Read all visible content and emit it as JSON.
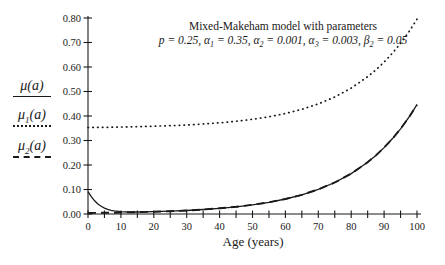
{
  "chart_data": {
    "type": "line",
    "title": "Mixed-Makeham model with parameters",
    "subtitle": "p = 0.25, a1 = 0.35, a2 = 0.001, a3 = 0.003, b2 = 0.05",
    "subtitle_segments": [
      {
        "t": "p = 0.25, α"
      },
      {
        "s": "1"
      },
      {
        "t": " = 0.35, α"
      },
      {
        "s": "2"
      },
      {
        "t": " = 0.001, α"
      },
      {
        "s": "3"
      },
      {
        "t": " = 0.003, β"
      },
      {
        "s": "2"
      },
      {
        "t": " = 0.05"
      }
    ],
    "xlabel": "Age (years)",
    "ylabel": "",
    "xlim": [
      0,
      100
    ],
    "ylim": [
      0,
      0.8
    ],
    "x_ticks": [
      0,
      10,
      20,
      30,
      40,
      50,
      60,
      70,
      80,
      90,
      100
    ],
    "x_minor_tick_step": 5,
    "y_ticks": [
      "0.00",
      "0.10",
      "0.20",
      "0.30",
      "0.40",
      "0.50",
      "0.60",
      "0.70",
      "0.80"
    ],
    "grid": "off",
    "legend_position": "left",
    "line_color": "#1a1a1a",
    "x": [
      0,
      1,
      2,
      3,
      4,
      5,
      6,
      7,
      8,
      10,
      12,
      15,
      20,
      25,
      30,
      35,
      40,
      45,
      50,
      55,
      60,
      65,
      70,
      75,
      80,
      82.5,
      85,
      87.5,
      90,
      92.5,
      95,
      97.5,
      100
    ],
    "series": [
      {
        "name": "mu2",
        "label": "μ2(a)",
        "style": "dashed",
        "values": [
          0.004,
          0.0042,
          0.0043,
          0.0045,
          0.0047,
          0.0049,
          0.005,
          0.0053,
          0.0055,
          0.006,
          0.0065,
          0.0074,
          0.0092,
          0.0115,
          0.0144,
          0.0183,
          0.0232,
          0.0295,
          0.0375,
          0.0479,
          0.0613,
          0.0784,
          0.1003,
          0.1286,
          0.1648,
          0.1876,
          0.2113,
          0.2393,
          0.2711,
          0.3071,
          0.3478,
          0.3939,
          0.4462
        ]
      },
      {
        "name": "mu",
        "label": "μ(a)",
        "style": "solid",
        "values": [
          0.0913,
          0.0706,
          0.054,
          0.041,
          0.0313,
          0.024,
          0.0188,
          0.0151,
          0.0125,
          0.0095,
          0.0082,
          0.008,
          0.0093,
          0.0115,
          0.0144,
          0.0183,
          0.0232,
          0.0295,
          0.0375,
          0.0479,
          0.0613,
          0.0784,
          0.1003,
          0.1286,
          0.1648,
          0.1876,
          0.2113,
          0.2393,
          0.2711,
          0.3071,
          0.3478,
          0.3939,
          0.4462
        ]
      },
      {
        "name": "mu1",
        "label": "μ1(a)",
        "style": "dotted",
        "values": [
          0.353,
          0.3532,
          0.3533,
          0.3535,
          0.3537,
          0.3539,
          0.354,
          0.3543,
          0.3545,
          0.355,
          0.3555,
          0.3564,
          0.3582,
          0.3605,
          0.3634,
          0.3673,
          0.3722,
          0.3785,
          0.3865,
          0.3969,
          0.4103,
          0.4274,
          0.4493,
          0.4776,
          0.5138,
          0.5366,
          0.5603,
          0.5883,
          0.6201,
          0.6561,
          0.6968,
          0.7429,
          0.7952
        ]
      }
    ]
  },
  "legend": {
    "items": [
      {
        "main": "μ",
        "sub": "",
        "rest": "(a)",
        "line": "solid"
      },
      {
        "main": "μ",
        "sub": "1",
        "rest": "(a)",
        "line": "dotted"
      },
      {
        "main": "μ",
        "sub": "2",
        "rest": "(a)",
        "line": "dashed"
      }
    ]
  }
}
